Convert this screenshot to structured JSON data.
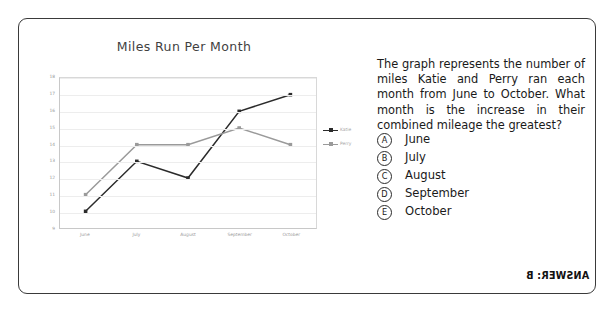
{
  "card": {
    "border_color": "#3a3a3a"
  },
  "chart_data": {
    "type": "line",
    "title": "Miles Run Per Month",
    "xlabel": "",
    "ylabel": "",
    "categories": [
      "June",
      "July",
      "August",
      "September",
      "October"
    ],
    "series": [
      {
        "name": "Katie",
        "values": [
          10,
          13,
          12,
          16,
          17
        ],
        "color": "#2b2b2b"
      },
      {
        "name": "Perry",
        "values": [
          11,
          14,
          14,
          15,
          14
        ],
        "color": "#9a9a9a"
      }
    ],
    "ylim": [
      9,
      18
    ],
    "yticks": [
      18,
      17,
      16,
      15,
      14,
      13,
      12,
      11,
      10,
      9
    ],
    "grid": true,
    "legend_position": "right"
  },
  "question": {
    "text": "The graph represents the number of miles Katie and Perry ran each month from June to October. What month is the increase in their combined mileage the greatest?",
    "choices": [
      {
        "letter": "A",
        "label": "June"
      },
      {
        "letter": "B",
        "label": "July"
      },
      {
        "letter": "C",
        "label": "August"
      },
      {
        "letter": "D",
        "label": "September"
      },
      {
        "letter": "E",
        "label": "October"
      }
    ],
    "answer_text": "ANSWER: B"
  }
}
